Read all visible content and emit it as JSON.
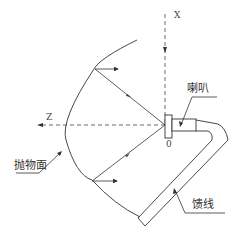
{
  "diagram": {
    "type": "parabolic-antenna-schematic",
    "axes": {
      "x_label": "X",
      "z_label": "Z",
      "origin_label": "0"
    },
    "labels": {
      "horn": "喇叭",
      "paraboloid": "抛物面",
      "feedline": "馈线"
    },
    "colors": {
      "line": "#333333",
      "background": "#ffffff"
    }
  }
}
